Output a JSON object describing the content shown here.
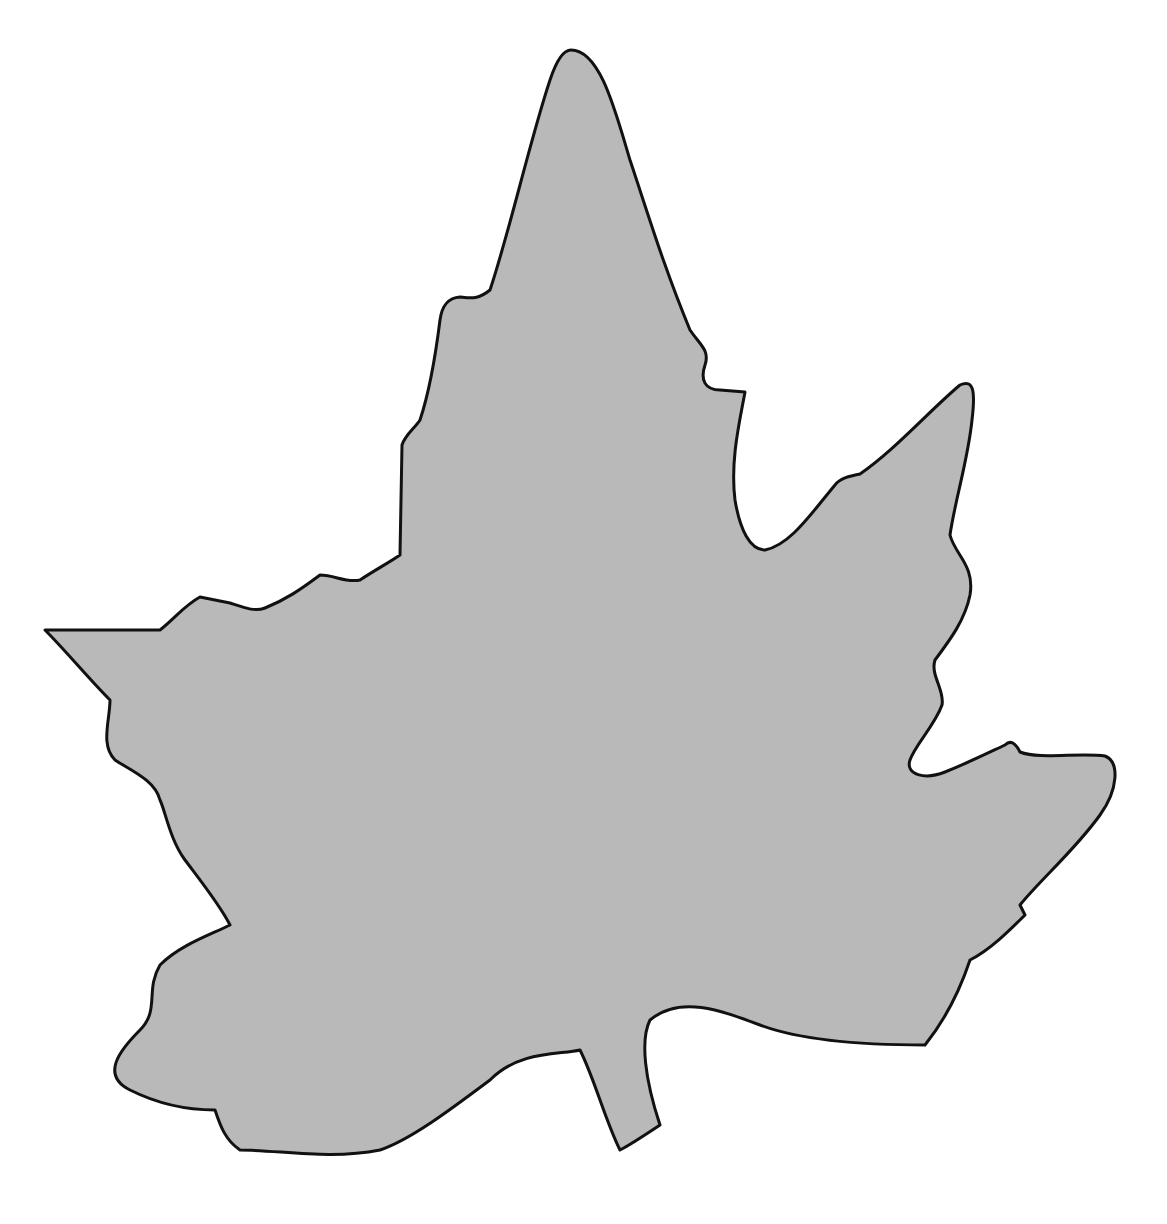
{
  "image": {
    "subject": "maple-leaf-silhouette",
    "fill_color": "#b9b9b9",
    "stroke_color": "#111111",
    "background_color": "#ffffff"
  }
}
